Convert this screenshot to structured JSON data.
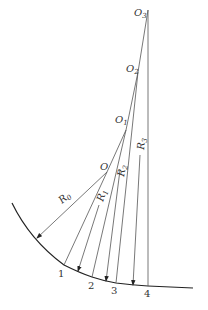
{
  "diagram": {
    "type": "multi-center arc construction",
    "centers": [
      {
        "id": "O",
        "label": "O",
        "x": 107,
        "y": 172
      },
      {
        "id": "O1",
        "label": "O",
        "sub": "1",
        "x": 126,
        "y": 130
      },
      {
        "id": "O2",
        "label": "O",
        "sub": "2",
        "x": 138,
        "y": 72
      },
      {
        "id": "O3",
        "label": "O",
        "sub": "3",
        "x": 148,
        "y": 10
      }
    ],
    "points": [
      {
        "label": "1",
        "x": 64,
        "y": 265
      },
      {
        "label": "2",
        "x": 92,
        "y": 277
      },
      {
        "label": "3",
        "x": 116,
        "y": 283
      },
      {
        "label": "4",
        "x": 148,
        "y": 286
      }
    ],
    "radii": [
      {
        "label": "R",
        "sub": "0"
      },
      {
        "label": "R",
        "sub": "1"
      },
      {
        "label": "R",
        "sub": "2"
      },
      {
        "label": "R",
        "sub": "3"
      }
    ],
    "colors": {
      "line": "#555555",
      "curve": "#222222",
      "text": "#333333"
    }
  }
}
